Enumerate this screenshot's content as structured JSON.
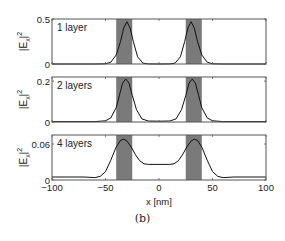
{
  "chart_data": {
    "type": "line",
    "caption": "(b)",
    "xlabel": "x [nm]",
    "xlim": [
      -100,
      100
    ],
    "xticks": [
      -100,
      -50,
      0,
      50,
      100
    ],
    "xtick_labels": [
      "−100",
      "−50",
      "0",
      "50",
      "100"
    ],
    "shaded_regions": [
      {
        "x0": -40,
        "x1": -25,
        "color": "#7a7a7a"
      },
      {
        "x0": 25,
        "x1": 40,
        "color": "#7a7a7a"
      }
    ],
    "panels": [
      {
        "label": "1 layer",
        "ylabel": "|E_x|^2",
        "ylim": [
          0,
          0.5
        ],
        "yticks": [
          0,
          0.5
        ],
        "ytick_labels": [
          "0",
          "0.5"
        ],
        "x": [
          -100,
          -60,
          -50,
          -45,
          -40,
          -36,
          -33,
          -30,
          -27,
          -24,
          -20,
          -15,
          -10,
          0,
          10,
          15,
          20,
          24,
          27,
          30,
          33,
          36,
          40,
          45,
          50,
          60,
          100
        ],
        "y": [
          0,
          0,
          0.002,
          0.02,
          0.1,
          0.25,
          0.4,
          0.47,
          0.4,
          0.25,
          0.08,
          0.01,
          0.001,
          0,
          0.001,
          0.01,
          0.08,
          0.25,
          0.4,
          0.47,
          0.4,
          0.25,
          0.1,
          0.02,
          0.002,
          0,
          0
        ]
      },
      {
        "label": "2 layers",
        "ylabel": "|E_x|^2",
        "ylim": [
          0,
          0.22
        ],
        "yticks": [
          0,
          0.2
        ],
        "ytick_labels": [
          "0",
          "0.2"
        ],
        "x": [
          -100,
          -60,
          -50,
          -45,
          -40,
          -37,
          -34,
          -31,
          -28,
          -25,
          -21,
          -16,
          -10,
          0,
          10,
          16,
          21,
          25,
          28,
          31,
          34,
          37,
          40,
          45,
          50,
          60,
          100
        ],
        "y": [
          0.002,
          0.002,
          0.006,
          0.02,
          0.07,
          0.13,
          0.19,
          0.21,
          0.19,
          0.13,
          0.06,
          0.015,
          0.005,
          0.004,
          0.005,
          0.015,
          0.06,
          0.13,
          0.19,
          0.21,
          0.19,
          0.13,
          0.07,
          0.02,
          0.006,
          0.002,
          0.002
        ]
      },
      {
        "label": "4 layers",
        "ylabel": "|E_x|^2",
        "ylim": [
          0,
          0.075
        ],
        "yticks": [
          0,
          0.06
        ],
        "ytick_labels": [
          "0",
          "0.06"
        ],
        "x": [
          -100,
          -70,
          -60,
          -55,
          -50,
          -45,
          -40,
          -36,
          -33,
          -30,
          -26,
          -22,
          -18,
          -14,
          -10,
          0,
          10,
          14,
          18,
          22,
          26,
          30,
          33,
          36,
          40,
          45,
          50,
          55,
          60,
          70,
          100
        ],
        "y": [
          0.005,
          0.005,
          0.004,
          0.006,
          0.014,
          0.033,
          0.055,
          0.066,
          0.068,
          0.065,
          0.055,
          0.042,
          0.032,
          0.027,
          0.026,
          0.026,
          0.026,
          0.027,
          0.032,
          0.042,
          0.055,
          0.065,
          0.068,
          0.066,
          0.055,
          0.033,
          0.014,
          0.006,
          0.004,
          0.005,
          0.005
        ]
      }
    ],
    "grid": false,
    "legend": null
  }
}
